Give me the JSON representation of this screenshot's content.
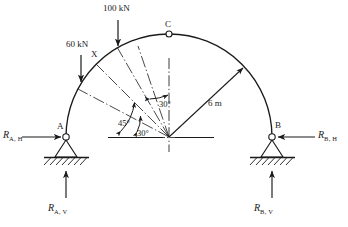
{
  "figure": {
    "type": "three-hinged-arch-free-body-diagram",
    "geometry": {
      "radius_label": "6 m",
      "center_x": 169,
      "center_y": 137,
      "radius_px": 103,
      "support_a_x": 66,
      "support_a_y": 137,
      "support_b_x": 272,
      "support_b_y": 137,
      "crown_x": 169,
      "crown_y": 34
    },
    "points": {
      "crown": "C",
      "left_support": "A",
      "right_support": "B",
      "load_point": "X"
    },
    "loads": [
      {
        "name": "load-100kn",
        "label": "100 kN",
        "magnitude": 100,
        "unit": "kN",
        "direction": "down",
        "applies_at": "X"
      },
      {
        "name": "load-60kn",
        "label": "60 kN",
        "magnitude": 60,
        "unit": "kN",
        "direction": "down",
        "applies_at": "arch-left-segment"
      }
    ],
    "angles": [
      {
        "name": "angle-30-upper",
        "label": "30°",
        "value": 30,
        "measured_from": "vertical-centerline"
      },
      {
        "name": "angle-45",
        "label": "45°",
        "value": 45,
        "measured_from": "horizontal-baseline"
      },
      {
        "name": "angle-30-lower",
        "label": "30°",
        "value": 30,
        "measured_from": "horizontal-baseline"
      }
    ],
    "reactions": [
      {
        "name": "reaction-a-h",
        "symbol": "R",
        "subscript": "A, H",
        "direction": "right",
        "at": "A"
      },
      {
        "name": "reaction-a-v",
        "symbol": "R",
        "subscript": "A, V",
        "direction": "up",
        "at": "A"
      },
      {
        "name": "reaction-b-h",
        "symbol": "R",
        "subscript": "B, H",
        "direction": "left",
        "at": "B"
      },
      {
        "name": "reaction-b-v",
        "symbol": "R",
        "subscript": "B, V",
        "direction": "up",
        "at": "B"
      }
    ],
    "colors": {
      "line": "#1a1a1a",
      "background": "#ffffff"
    }
  }
}
